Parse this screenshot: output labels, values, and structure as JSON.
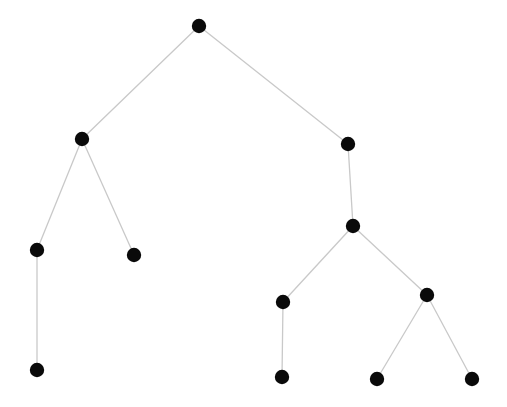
{
  "figure": {
    "type": "node-link-tree-diagram",
    "width": 507,
    "height": 407,
    "background_color": "#ffffff",
    "node_color": "#0a0a0a",
    "node_radius": 7.2,
    "edge_color": "#c9c9c9",
    "edge_width": 1.3,
    "title": "",
    "labels_visible": false
  },
  "graph": {
    "node_count": 12,
    "edge_count": 11,
    "directed": false,
    "layout": "hierarchical-tree",
    "root_id": "n0",
    "depth": 5,
    "nodes": [
      {
        "id": "n0",
        "name": "root",
        "x": 199,
        "y": 26,
        "depth": 0,
        "children_count": 2
      },
      {
        "id": "n1",
        "name": "left-branch",
        "x": 82,
        "y": 139,
        "depth": 1,
        "children_count": 2
      },
      {
        "id": "n2",
        "name": "right-branch",
        "x": 348,
        "y": 144,
        "depth": 1,
        "children_count": 1
      },
      {
        "id": "n3",
        "name": "left-inner",
        "x": 37,
        "y": 250,
        "depth": 2,
        "children_count": 1
      },
      {
        "id": "n4",
        "name": "left-leaf-upper",
        "x": 134,
        "y": 255,
        "depth": 2,
        "children_count": 0
      },
      {
        "id": "n5",
        "name": "left-leaf-lower",
        "x": 37,
        "y": 370,
        "depth": 3,
        "children_count": 0
      },
      {
        "id": "n6",
        "name": "right-inner",
        "x": 353,
        "y": 226,
        "depth": 2,
        "children_count": 2
      },
      {
        "id": "n7",
        "name": "right-inner-left",
        "x": 283,
        "y": 302,
        "depth": 3,
        "children_count": 1
      },
      {
        "id": "n8",
        "name": "right-inner-right",
        "x": 427,
        "y": 295,
        "depth": 3,
        "children_count": 2
      },
      {
        "id": "n9",
        "name": "right-leaf-center",
        "x": 282,
        "y": 377,
        "depth": 4,
        "children_count": 0
      },
      {
        "id": "n10",
        "name": "right-leaf-mid",
        "x": 377,
        "y": 379,
        "depth": 4,
        "children_count": 0
      },
      {
        "id": "n11",
        "name": "right-leaf-far",
        "x": 472,
        "y": 379,
        "depth": 4,
        "children_count": 0
      }
    ],
    "edges": [
      {
        "id": "e0",
        "source": "n0",
        "target": "n1",
        "x1": 199,
        "y1": 26,
        "x2": 82,
        "y2": 139
      },
      {
        "id": "e1",
        "source": "n0",
        "target": "n2",
        "x1": 199,
        "y1": 26,
        "x2": 348,
        "y2": 144
      },
      {
        "id": "e2",
        "source": "n1",
        "target": "n3",
        "x1": 82,
        "y1": 139,
        "x2": 37,
        "y2": 250
      },
      {
        "id": "e3",
        "source": "n1",
        "target": "n4",
        "x1": 82,
        "y1": 139,
        "x2": 134,
        "y2": 255
      },
      {
        "id": "e4",
        "source": "n3",
        "target": "n5",
        "x1": 37,
        "y1": 250,
        "x2": 37,
        "y2": 370
      },
      {
        "id": "e5",
        "source": "n2",
        "target": "n6",
        "x1": 348,
        "y1": 144,
        "x2": 353,
        "y2": 226
      },
      {
        "id": "e6",
        "source": "n6",
        "target": "n7",
        "x1": 353,
        "y1": 226,
        "x2": 283,
        "y2": 302
      },
      {
        "id": "e7",
        "source": "n6",
        "target": "n8",
        "x1": 353,
        "y1": 226,
        "x2": 427,
        "y2": 295
      },
      {
        "id": "e8",
        "source": "n7",
        "target": "n9",
        "x1": 283,
        "y1": 302,
        "x2": 282,
        "y2": 377
      },
      {
        "id": "e9",
        "source": "n8",
        "target": "n10",
        "x1": 427,
        "y1": 295,
        "x2": 377,
        "y2": 379
      },
      {
        "id": "e10",
        "source": "n8",
        "target": "n11",
        "x1": 427,
        "y1": 295,
        "x2": 472,
        "y2": 379
      }
    ]
  }
}
